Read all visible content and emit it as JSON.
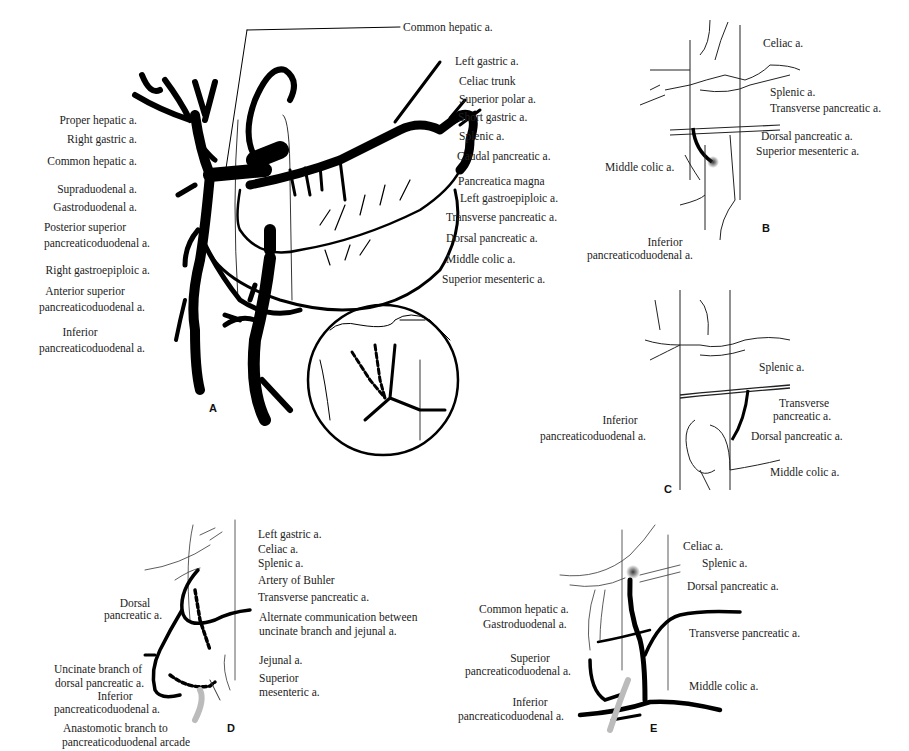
{
  "figure": {
    "panels": [
      {
        "id": "A",
        "letter": "A",
        "labels_left": [
          "Proper hepatic a.",
          "Right gastric a.",
          "Common hepatic a.",
          "Supraduodenal a.",
          "Gastroduodenal a.",
          "Posterior superior",
          "pancreaticoduodenal a.",
          "Right gastroepiploic a.",
          "Anterior superior",
          "pancreaticoduodenal a.",
          "Inferior",
          "pancreaticoduodenal a."
        ],
        "labels_right": [
          "Common hepatic a.",
          "Left gastric a.",
          "Celiac trunk",
          "Superior polar a.",
          "Short gastric a.",
          "Splenic a.",
          "Caudal pancreatic a.",
          "Pancreatica magna",
          "Left gastroepiploic a.",
          "Transverse pancreatic a.",
          "Dorsal pancreatic a.",
          "Middle colic a.",
          "Superior mesenteric a."
        ]
      },
      {
        "id": "B",
        "letter": "B",
        "labels": [
          "Celiac a.",
          "Splenic a.",
          "Transverse pancreatic a.",
          "Dorsal pancreatic a.",
          "Superior mesenteric a.",
          "Middle colic a.",
          "Inferior",
          "pancreaticoduodenal a."
        ]
      },
      {
        "id": "C",
        "letter": "C",
        "labels": [
          "Splenic a.",
          "Transverse",
          "pancreatic a.",
          "Inferior",
          "pancreaticoduodenal a.",
          "Dorsal pancreatic a.",
          "Middle colic a."
        ]
      },
      {
        "id": "D",
        "letter": "D",
        "labels": [
          "Left gastric a.",
          "Celiac a.",
          "Splenic a.",
          "Artery of Buhler",
          "Transverse pancreatic a.",
          "Alternate communication between",
          "uncinate branch and jejunal a.",
          "Jejunal a.",
          "Superior",
          "mesenteric a.",
          "Dorsal",
          "pancreatic a.",
          "Uncinate branch of",
          "dorsal pancreatic a.",
          "Inferior",
          "pancreaticoduodenal a.",
          "Anastomotic branch to",
          "pancreaticoduodenal arcade"
        ]
      },
      {
        "id": "E",
        "letter": "E",
        "labels": [
          "Celiac a.",
          "Splenic a.",
          "Dorsal pancreatic a.",
          "Common hepatic a.",
          "Gastroduodenal a.",
          "Transverse pancreatic a.",
          "Superior",
          "pancreaticoduodenal a.",
          "Inferior",
          "pancreaticoduodenal a.",
          "Middle colic a."
        ]
      }
    ]
  }
}
